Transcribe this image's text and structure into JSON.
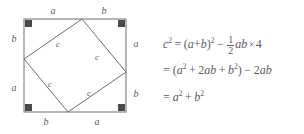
{
  "figure": {
    "outer_square": {
      "x": 24,
      "y": 19,
      "width": 102,
      "height": 93
    },
    "inner_square_vertices": [
      {
        "x": 82,
        "y": 19
      },
      {
        "x": 126,
        "y": 72
      },
      {
        "x": 68,
        "y": 112
      },
      {
        "x": 24,
        "y": 59
      }
    ],
    "stroke_color": "#6e6e70",
    "corner_marker_color": "#4a4a4c",
    "label_color": "#59595b",
    "edge_labels": [
      {
        "name": "top-left-a",
        "text": "a",
        "x": 53,
        "y": 11
      },
      {
        "name": "top-right-b",
        "text": "b",
        "x": 104,
        "y": 11
      },
      {
        "name": "right-upper-a",
        "text": "a",
        "x": 136,
        "y": 44
      },
      {
        "name": "right-lower-b",
        "text": "b",
        "x": 136,
        "y": 94
      },
      {
        "name": "bottom-left-b",
        "text": "b",
        "x": 46,
        "y": 122
      },
      {
        "name": "bottom-right-a",
        "text": "a",
        "x": 97,
        "y": 122
      },
      {
        "name": "left-upper-b",
        "text": "b",
        "x": 14,
        "y": 39
      },
      {
        "name": "left-lower-a",
        "text": "a",
        "x": 14,
        "y": 88
      }
    ],
    "hypotenuse_labels": [
      {
        "name": "c-top-left",
        "text": "c",
        "x": 58,
        "y": 44
      },
      {
        "name": "c-top-right",
        "text": "c",
        "x": 97,
        "y": 57
      },
      {
        "name": "c-bottom-left",
        "text": "c",
        "x": 50,
        "y": 84
      },
      {
        "name": "c-bottom-right",
        "text": "c",
        "x": 89,
        "y": 93
      }
    ]
  },
  "equations": {
    "line1": {
      "plain": "c^2 = (a+b)^2 - (1/2)ab x 4",
      "lhs_var": "c",
      "lhs_exp": "2",
      "equals": "=",
      "open_paren": "(",
      "term_a": "a",
      "plus": "+",
      "term_b": "b",
      "close_paren": ")",
      "group_exp": "2",
      "minus": "−",
      "frac_num": "1",
      "frac_den": "2",
      "prod_a": "a",
      "prod_b": "b",
      "times": "×",
      "count": "4"
    },
    "line2": {
      "plain": "= (a^2 + 2ab + b^2) - 2ab",
      "equals": "=",
      "open_paren": "(",
      "a_var": "a",
      "a_exp": "2",
      "plus1": "+",
      "coef2": "2",
      "ab_1": "a",
      "ab_2": "b",
      "plus2": "+",
      "b_var": "b",
      "b_exp": "2",
      "close_paren": ")",
      "minus": "−",
      "coef2b": "2",
      "ab2_1": "a",
      "ab2_2": "b"
    },
    "line3": {
      "plain": "= a^2 + b^2",
      "equals": "=",
      "a_var": "a",
      "a_exp": "2",
      "plus": "+",
      "b_var": "b",
      "b_exp": "2"
    }
  }
}
